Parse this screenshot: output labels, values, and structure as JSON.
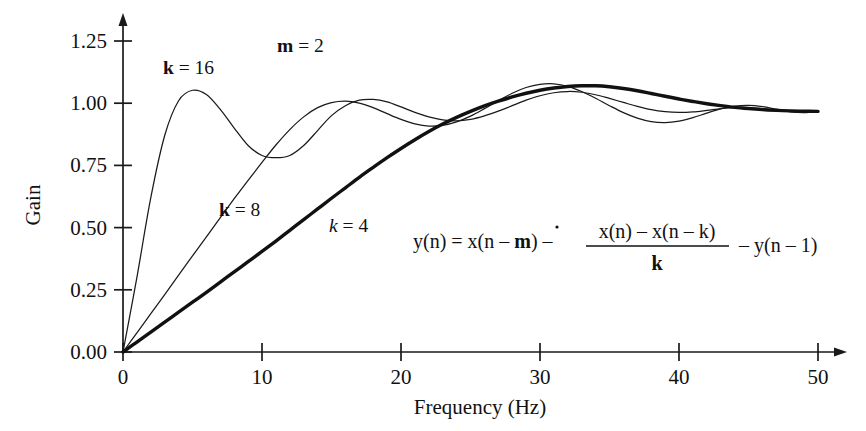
{
  "axes": {
    "x": {
      "title": "Frequency (Hz)",
      "ticks": [
        "0",
        "10",
        "20",
        "30",
        "40",
        "50"
      ],
      "tick_values": [
        0,
        10,
        20,
        30,
        40,
        50
      ],
      "min": 0,
      "max": 50,
      "has_arrow": true
    },
    "y": {
      "title": "Gain",
      "ticks": [
        "0.00",
        "0.25",
        "0.50",
        "0.75",
        "1.00",
        "1.25"
      ],
      "tick_values": [
        0.0,
        0.25,
        0.5,
        0.75,
        1.0,
        1.25
      ],
      "min": 0.0,
      "max": 1.25,
      "has_arrow": true
    }
  },
  "annotations": {
    "m_label": {
      "sym": "m",
      "rest": " = 2"
    },
    "k16_label": {
      "sym": "k",
      "rest": " = 16"
    },
    "k8_label": {
      "sym": "k",
      "rest": " = 8"
    },
    "k4_label": {
      "sym": "k",
      "rest": " = 4"
    }
  },
  "equation": {
    "lhs": "y(n) = x(n – ",
    "lhs_sym": "m",
    "lhs_tail": ") –",
    "num": "x(n) – x(n – k)",
    "den": "k",
    "rhs": "– y(n – 1)",
    "plain": "y(n) = x(n – m) – [x(n) – x(n – k)] / k – y(n – 1)"
  },
  "colors": {
    "ink": "#1a1a1a",
    "background": "#ffffff"
  },
  "chart_data": {
    "type": "line",
    "title": "",
    "xlabel": "Frequency (Hz)",
    "ylabel": "Gain",
    "xlim": [
      0,
      50
    ],
    "ylim": [
      0.0,
      1.25
    ],
    "grid": false,
    "legend": "inline-annotations",
    "x": [
      0,
      1,
      2,
      3,
      4,
      5,
      6,
      7,
      8,
      9,
      10,
      11,
      12,
      13,
      14,
      15,
      16,
      17,
      18,
      19,
      20,
      21,
      22,
      23,
      24,
      25,
      26,
      27,
      28,
      29,
      30,
      31,
      32,
      33,
      34,
      35,
      36,
      37,
      38,
      39,
      40,
      41,
      42,
      43,
      44,
      45,
      46,
      47,
      48,
      49,
      50
    ],
    "series": [
      {
        "name": "k = 16",
        "style": "thin",
        "values": [
          0.0,
          0.3,
          0.62,
          0.87,
          1.01,
          1.052,
          1.035,
          0.975,
          0.9,
          0.83,
          0.79,
          0.781,
          0.79,
          0.83,
          0.89,
          0.95,
          0.99,
          1.012,
          1.015,
          1.005,
          0.985,
          0.963,
          0.945,
          0.933,
          0.929,
          0.935,
          0.949,
          0.968,
          0.99,
          1.012,
          1.03,
          1.042,
          1.047,
          1.044,
          1.034,
          1.019,
          1.003,
          0.987,
          0.974,
          0.966,
          0.963,
          0.965,
          0.971,
          0.978,
          0.983,
          0.983,
          0.978,
          0.971,
          0.966,
          0.964,
          0.967
        ]
      },
      {
        "name": "k = 8",
        "style": "thin",
        "values": [
          0.0,
          0.077,
          0.154,
          0.231,
          0.309,
          0.386,
          0.463,
          0.54,
          0.616,
          0.69,
          0.762,
          0.832,
          0.894,
          0.945,
          0.982,
          1.002,
          1.008,
          1.0,
          0.982,
          0.958,
          0.935,
          0.917,
          0.908,
          0.911,
          0.925,
          0.948,
          0.978,
          1.01,
          1.04,
          1.063,
          1.076,
          1.078,
          1.068,
          1.047,
          1.02,
          0.99,
          0.962,
          0.94,
          0.926,
          0.922,
          0.928,
          0.942,
          0.96,
          0.977,
          0.988,
          0.991,
          0.986,
          0.976,
          0.966,
          0.962,
          0.967
        ]
      },
      {
        "name": "k = 4",
        "style": "thick",
        "values": [
          0.0,
          0.04,
          0.08,
          0.12,
          0.16,
          0.2,
          0.24,
          0.281,
          0.322,
          0.363,
          0.404,
          0.446,
          0.489,
          0.532,
          0.575,
          0.618,
          0.66,
          0.702,
          0.742,
          0.781,
          0.818,
          0.853,
          0.886,
          0.916,
          0.943,
          0.967,
          0.989,
          1.008,
          1.025,
          1.04,
          1.052,
          1.061,
          1.067,
          1.07,
          1.07,
          1.066,
          1.059,
          1.05,
          1.039,
          1.028,
          1.017,
          1.007,
          0.998,
          0.99,
          0.983,
          0.978,
          0.974,
          0.971,
          0.969,
          0.968,
          0.967
        ]
      }
    ]
  }
}
